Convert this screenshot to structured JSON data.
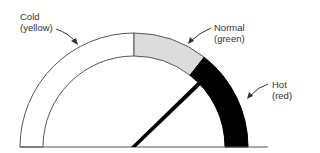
{
  "diagram": {
    "type": "gauge",
    "zones": [
      {
        "name": "Cold",
        "color_name": "yellow",
        "fill": "#ffffff"
      },
      {
        "name": "Normal",
        "color_name": "green",
        "fill": "#dcdcdc"
      },
      {
        "name": "Hot",
        "color_name": "red",
        "fill": "#000000"
      }
    ],
    "labels": {
      "cold": {
        "line1": "Cold",
        "line2": "(yellow)"
      },
      "normal": {
        "line1": "Normal",
        "line2": "(green)"
      },
      "hot": {
        "line1": "Hot",
        "line2": "(red)"
      }
    },
    "needle": {
      "zone": "Normal",
      "color": "#000000"
    },
    "colors": {
      "outline": "#555555",
      "normal_fill": "#dcdcdc",
      "hot_fill": "#000000"
    }
  }
}
